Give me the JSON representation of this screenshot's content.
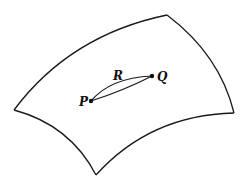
{
  "diagram": {
    "title": "",
    "colors": {
      "stroke": "#1a1a1a",
      "background": "#ffffff"
    },
    "surface": {
      "corners": {
        "left": [
          14,
          110
        ],
        "top": [
          167,
          15
        ],
        "right": [
          234,
          113
        ],
        "bottom": [
          96,
          175
        ]
      }
    },
    "points": [
      {
        "id": "P",
        "label": "P",
        "x": 91,
        "y": 101
      },
      {
        "id": "Q",
        "label": "Q",
        "x": 152,
        "y": 76
      }
    ],
    "curves": [
      {
        "id": "R",
        "label": "R",
        "from": "P",
        "to": "Q",
        "label_x": 117,
        "label_y": 80
      },
      {
        "id": "straight",
        "label": "",
        "from": "P",
        "to": "Q"
      }
    ]
  }
}
